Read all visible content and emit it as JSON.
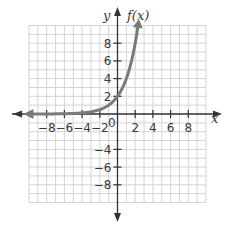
{
  "chart_data": {
    "type": "line",
    "title": "",
    "xlabel": "x",
    "ylabel": "y",
    "function_label": "f(x)",
    "xlim": [
      -10,
      10
    ],
    "ylim": [
      -10,
      10
    ],
    "grid": true,
    "grid_step": 1,
    "x_ticks": [
      -8,
      -6,
      -4,
      -2,
      0,
      2,
      4,
      6,
      8
    ],
    "x_tick_labels": [
      "-8",
      "-6",
      "-4",
      "-2",
      "0",
      "2",
      "4",
      "6",
      "8"
    ],
    "y_ticks": [
      -8,
      -6,
      -4,
      2,
      4,
      6,
      8
    ],
    "y_tick_labels": [
      "-8",
      "-6",
      "-4",
      "2",
      "4",
      "6",
      "8"
    ],
    "series": [
      {
        "name": "f(x)",
        "description": "exponential growth curve, horizontal asymptote y=0 on the left, arrows at both ends",
        "x": [
          -9.5,
          -6,
          -4,
          -3,
          -2,
          -1,
          0,
          1,
          2,
          2.3
        ],
        "values": [
          0.003,
          0.03,
          0.13,
          0.25,
          0.5,
          1,
          2,
          4,
          8,
          9.8
        ]
      }
    ],
    "colors": {
      "curve": "#7a7a7a",
      "axes": "#333333",
      "grid": "#d4d4d4",
      "text": "#3a3a3a"
    }
  },
  "labels": {
    "x_axis": "x",
    "y_axis": "y",
    "function": "f(x)",
    "origin": "0"
  }
}
